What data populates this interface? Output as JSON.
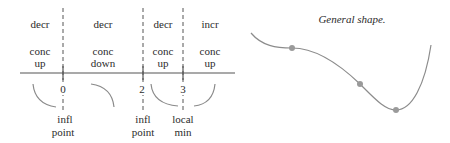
{
  "sign_chart": {
    "intervals": [
      {
        "monotonic": "decr",
        "concavity_line1": "conc",
        "concavity_line2": "up"
      },
      {
        "monotonic": "decr",
        "concavity_line1": "conc",
        "concavity_line2": "down"
      },
      {
        "monotonic": "decr",
        "concavity_line1": "conc",
        "concavity_line2": "up"
      },
      {
        "monotonic": "incr",
        "concavity_line1": "conc",
        "concavity_line2": "up"
      }
    ],
    "critical_points": [
      {
        "x": "0",
        "label_line1": "infl",
        "label_line2": "point"
      },
      {
        "x": "2",
        "label_line1": "infl",
        "label_line2": "point"
      },
      {
        "x": "3",
        "label_line1": "local",
        "label_line2": "min"
      }
    ]
  },
  "graph": {
    "title": "General shape.",
    "points": [
      "inflection-0",
      "inflection-2",
      "local-min-3"
    ]
  },
  "colors": {
    "axis": "#555555",
    "curve": "#8c8c8c",
    "dot": "#9a9a9a",
    "text": "#2b2b2b"
  }
}
